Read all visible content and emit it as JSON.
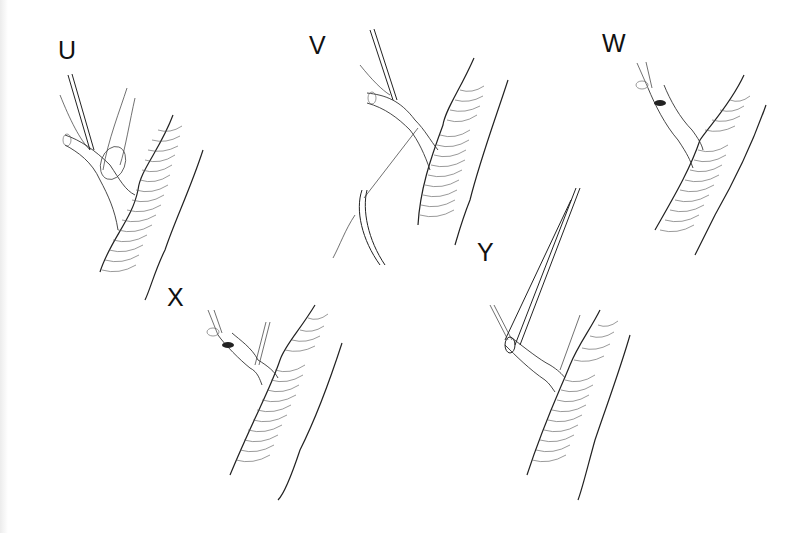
{
  "figure": {
    "type": "surgical-illustration",
    "panels": [
      {
        "id": "U",
        "label": "U",
        "description": "Forceps gripping branch vessel with suture loop around its base"
      },
      {
        "id": "V",
        "label": "V",
        "description": "Suture ligature passed with needle holder around branch at junction"
      },
      {
        "id": "W",
        "label": "W",
        "description": "Ligated branch stump with opening near tip"
      },
      {
        "id": "X",
        "label": "X",
        "description": "Branch with ligature tied, showing constricted segments"
      },
      {
        "id": "Y",
        "label": "Y",
        "description": "Forceps/clamp inserted into branch opening beyond ligature"
      }
    ]
  },
  "colors": {
    "background": "#ffffff",
    "ink": "#222222"
  }
}
